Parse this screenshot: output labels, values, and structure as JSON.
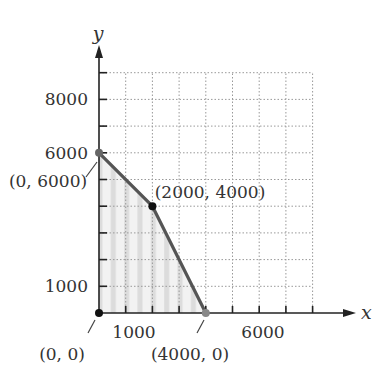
{
  "chart_data": {
    "type": "line",
    "title": "",
    "xlabel": "x",
    "ylabel": "y",
    "xlim": [
      0,
      8000
    ],
    "ylim": [
      0,
      9000
    ],
    "grid": true,
    "x_ticks": [
      1000,
      2000,
      3000,
      4000,
      5000,
      6000,
      7000,
      8000
    ],
    "y_ticks": [
      1000,
      2000,
      3000,
      4000,
      5000,
      6000,
      7000,
      8000,
      9000
    ],
    "x_tick_labels": [
      {
        "value": 1000,
        "text": "1000"
      },
      {
        "value": 6000,
        "text": "6000"
      }
    ],
    "y_tick_labels": [
      {
        "value": 1000,
        "text": "1000"
      },
      {
        "value": 6000,
        "text": "6000"
      },
      {
        "value": 8000,
        "text": "8000"
      }
    ],
    "series": [
      {
        "name": "feasible region boundary",
        "points": [
          [
            0,
            6000
          ],
          [
            2000,
            4000
          ],
          [
            4000,
            0
          ]
        ]
      }
    ],
    "shaded_region": {
      "vertices": [
        [
          0,
          0
        ],
        [
          0,
          6000
        ],
        [
          2000,
          4000
        ],
        [
          4000,
          0
        ]
      ]
    },
    "annotations": [
      {
        "text": "(0, 6000)",
        "point": [
          0,
          6000
        ]
      },
      {
        "text": "(2000, 4000)",
        "point": [
          2000,
          4000
        ]
      },
      {
        "text": "(0, 0)",
        "point": [
          0,
          0
        ]
      },
      {
        "text": "(4000, 0)",
        "point": [
          4000,
          0
        ]
      }
    ],
    "colors": {
      "boundary": "#555555",
      "shade": "#e6e6e6",
      "grid": "#999999",
      "axis": "#222222",
      "vertex": "#111111"
    }
  }
}
